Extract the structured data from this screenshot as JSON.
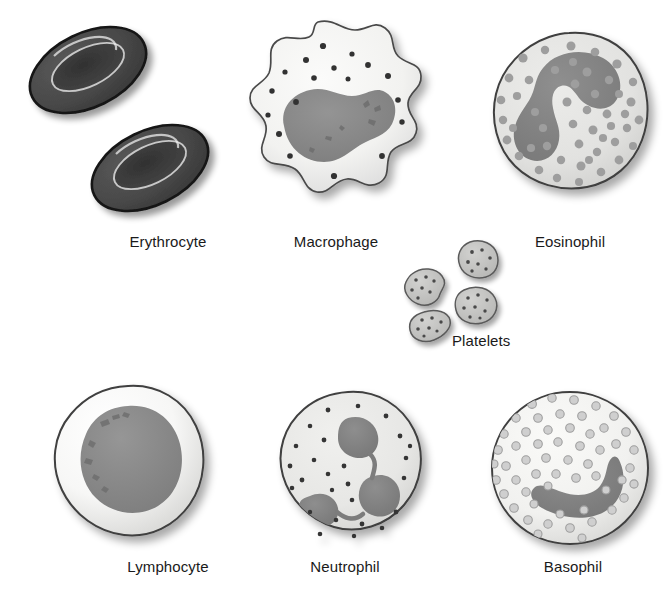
{
  "figure": {
    "background_color": "#ffffff",
    "label_color": "#1a1a1a"
  },
  "palette": {
    "erythrocyte_body": "#4a4a4a",
    "erythrocyte_outline": "#1c1c1c",
    "erythrocyte_dimple": "#3c3c3c",
    "cytoplasm_pale": "#f2f2f0",
    "cytoplasm_gray": "#e3e3e1",
    "nucleus_gray": "#8c8c8c",
    "nucleus_dark": "#777777",
    "granule_dark": "#3a3a3a",
    "granule_mid": "#9a9a9a",
    "granule_light": "#c9c9c9",
    "outline": "#3d3d3d",
    "shadow": "#b9b9b9"
  },
  "cells": [
    {
      "id": "erythrocyte",
      "label": "Erythrocyte",
      "label_x": 168,
      "label_y": 243,
      "description": "Two dark biconcave discs with central depression",
      "count": 2,
      "nucleus": "none",
      "granules": 0
    },
    {
      "id": "macrophage",
      "label": "Macrophage",
      "label_x": 336,
      "label_y": 243,
      "description": "Amoeboid lobed cell with kidney-shaped nucleus and scattered dark granules",
      "count": 1,
      "nucleus": "kidney-shaped",
      "granules": 18
    },
    {
      "id": "eosinophil",
      "label": "Eosinophil",
      "label_x": 570,
      "label_y": 243,
      "description": "Round cell with bilobed C-shaped nucleus and many medium granules",
      "count": 1,
      "nucleus": "bilobed",
      "granules": 58
    },
    {
      "id": "platelets",
      "label": "Platelets",
      "label_x": 452,
      "label_y": 342,
      "description": "Four small irregular cell fragments with dark speckles",
      "count": 4,
      "nucleus": "none",
      "granules": 26
    },
    {
      "id": "lymphocyte",
      "label": "Lymphocyte",
      "label_x": 168,
      "label_y": 568,
      "description": "Round cell with large round nucleus filling most of the cell and thin pale cytoplasm rim",
      "count": 1,
      "nucleus": "large round",
      "granules": 0
    },
    {
      "id": "neutrophil",
      "label": "Neutrophil",
      "label_x": 345,
      "label_y": 568,
      "description": "Round cell with trilobed nucleus joined by thin filaments and small dark granules",
      "count": 1,
      "nucleus": "trilobed",
      "granules": 26
    },
    {
      "id": "basophil",
      "label": "Basophil",
      "label_x": 573,
      "label_y": 568,
      "description": "Round cell densely packed with light ringed granules and a curved band nucleus",
      "count": 1,
      "nucleus": "band-shaped",
      "granules": 72
    }
  ]
}
